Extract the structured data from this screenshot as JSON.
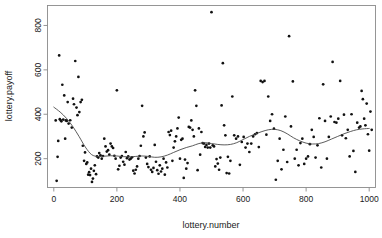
{
  "chart_data": {
    "type": "scatter",
    "title": "",
    "xlabel": "lottery.number",
    "ylabel": "lottery.payoff",
    "xlim": [
      -20,
      1020
    ],
    "ylim": [
      70,
      890
    ],
    "grid": false,
    "legend": null,
    "xticks": [
      0,
      200,
      400,
      600,
      800,
      1000
    ],
    "yticks": [
      200,
      400,
      600,
      800
    ],
    "xtick_labels": [
      "0",
      "200",
      "400",
      "600",
      "800",
      "1000"
    ],
    "ytick_labels": [
      "200",
      "400",
      "600",
      "800"
    ],
    "point_marker": "filled-circle",
    "point_color": "#111111",
    "smoother_color": "#4a4a4a",
    "smoother_name": "lowess",
    "series": [
      {
        "name": "lottery draw",
        "x": [
          6,
          9,
          12,
          14,
          17,
          19,
          22,
          24,
          27,
          30,
          33,
          36,
          38,
          41,
          44,
          47,
          52,
          57,
          61,
          64,
          68,
          72,
          75,
          78,
          81,
          85,
          89,
          92,
          96,
          99,
          103,
          106,
          109,
          112,
          115,
          118,
          121,
          124,
          127,
          130,
          134,
          137,
          141,
          144,
          148,
          152,
          156,
          160,
          164,
          168,
          172,
          176,
          180,
          184,
          188,
          192,
          196,
          200,
          204,
          208,
          212,
          216,
          220,
          224,
          228,
          232,
          236,
          240,
          244,
          248,
          252,
          256,
          260,
          264,
          268,
          272,
          276,
          280,
          284,
          288,
          292,
          296,
          300,
          304,
          308,
          312,
          316,
          320,
          324,
          328,
          332,
          336,
          340,
          344,
          348,
          352,
          356,
          360,
          364,
          368,
          372,
          376,
          380,
          384,
          388,
          392,
          396,
          400,
          404,
          408,
          412,
          416,
          420,
          424,
          428,
          432,
          436,
          440,
          444,
          448,
          452,
          456,
          460,
          464,
          468,
          472,
          476,
          480,
          484,
          488,
          492,
          496,
          500,
          504,
          508,
          512,
          516,
          520,
          524,
          528,
          532,
          536,
          540,
          544,
          548,
          552,
          556,
          560,
          566,
          572,
          578,
          584,
          590,
          596,
          602,
          608,
          614,
          620,
          626,
          632,
          638,
          644,
          650,
          656,
          662,
          668,
          674,
          680,
          686,
          692,
          698,
          704,
          710,
          716,
          722,
          728,
          734,
          740,
          746,
          752,
          758,
          764,
          770,
          776,
          782,
          788,
          794,
          800,
          806,
          812,
          818,
          824,
          830,
          836,
          842,
          848,
          854,
          860,
          866,
          872,
          878,
          884,
          890,
          896,
          902,
          908,
          914,
          920,
          926,
          932,
          938,
          944,
          950,
          956,
          962,
          968,
          972,
          976,
          980,
          984,
          988,
          992,
          996,
          1000,
          1004,
          1008
        ],
        "y": [
          372,
          100,
          208,
          280,
          665,
          378,
          372,
          368,
          533,
          376,
          485,
          290,
          372,
          370,
          455,
          358,
          373,
          340,
          470,
          445,
          640,
          430,
          396,
          568,
          410,
          455,
          465,
          258,
          190,
          228,
          176,
          183,
          128,
          139,
          126,
          155,
          95,
          110,
          145,
          170,
          130,
          210,
          205,
          225,
          215,
          200,
          212,
          290,
          255,
          232,
          238,
          218,
          268,
          255,
          248,
          213,
          200,
          508,
          152,
          168,
          205,
          212,
          186,
          173,
          230,
          202,
          210,
          196,
          200,
          206,
          146,
          133,
          150,
          165,
          200,
          212,
          258,
          438,
          300,
          318,
          205,
          176,
          162,
          210,
          150,
          140,
          158,
          262,
          186,
          148,
          132,
          170,
          142,
          155,
          200,
          128,
          183,
          160,
          320,
          306,
          326,
          190,
          250,
          278,
          300,
          336,
          385,
          200,
          285,
          290,
          113,
          196,
          155,
          180,
          343,
          340,
          372,
          330,
          300,
          508,
          438,
          148,
          336,
          218,
          320,
          270,
          268,
          253,
          262,
          250,
          268,
          250,
          860,
          260,
          255,
          165,
          198,
          178,
          150,
          205,
          440,
          630,
          350,
          305,
          135,
          208,
          133,
          190,
          480,
          305,
          290,
          300,
          172,
          275,
          298,
          250,
          268,
          230,
          268,
          300,
          310,
          315,
          252,
          550,
          545,
          550,
          308,
          480,
          370,
          400,
          335,
          105,
          190,
          290,
          152,
          240,
          390,
          185,
          752,
          345,
          548,
          200,
          240,
          170,
          270,
          290,
          176,
          200,
          210,
          265,
          330,
          298,
          205,
          260,
          382,
          160,
          535,
          370,
          200,
          298,
          390,
          636,
          365,
          362,
          380,
          550,
          305,
          398,
          292,
          330,
          210,
          400,
          235,
          140,
          362,
          340,
          345,
          505,
          468,
          380,
          350,
          448,
          310,
          236,
          412,
          330
        ]
      }
    ],
    "smoother_points": {
      "x": [
        0,
        20,
        40,
        60,
        80,
        100,
        120,
        140,
        160,
        180,
        200,
        220,
        240,
        260,
        280,
        300,
        320,
        340,
        360,
        380,
        400,
        420,
        440,
        460,
        480,
        500,
        520,
        540,
        560,
        580,
        600,
        620,
        640,
        660,
        680,
        700,
        720,
        740,
        760,
        780,
        800,
        820,
        840,
        860,
        880,
        900,
        920,
        940,
        960,
        980,
        1000
      ],
      "y": [
        432,
        410,
        382,
        345,
        300,
        252,
        218,
        210,
        211,
        213,
        212,
        209,
        208,
        210,
        212,
        210,
        206,
        208,
        216,
        228,
        240,
        250,
        258,
        268,
        272,
        268,
        264,
        262,
        264,
        272,
        286,
        300,
        312,
        322,
        330,
        332,
        326,
        312,
        294,
        280,
        270,
        266,
        268,
        276,
        288,
        300,
        312,
        322,
        330,
        334,
        336
      ]
    }
  }
}
